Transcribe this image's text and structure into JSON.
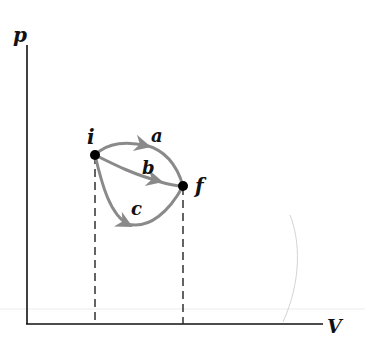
{
  "diagram": {
    "type": "pV-diagram",
    "axes": {
      "y_label": "p",
      "x_label": "V"
    },
    "points": [
      {
        "id": "i",
        "label": "i"
      },
      {
        "id": "f",
        "label": "f"
      }
    ],
    "paths": [
      {
        "id": "a",
        "label": "a",
        "from": "i",
        "to": "f",
        "shape": "arcs above"
      },
      {
        "id": "b",
        "label": "b",
        "from": "i",
        "to": "f",
        "shape": "nearly straight"
      },
      {
        "id": "c",
        "label": "c",
        "from": "i",
        "to": "f",
        "shape": "dips below"
      }
    ],
    "colors": {
      "axis": "#111111",
      "path": "#8a8a8a",
      "point": "#000000",
      "dashed": "#222222"
    }
  }
}
